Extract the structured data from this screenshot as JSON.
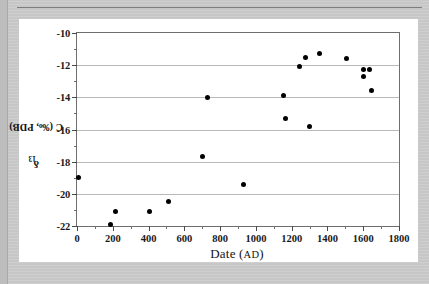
{
  "figure": {
    "background_color": "#ffffff",
    "page_background_color": "#c9c9c9"
  },
  "chart_data": {
    "type": "scatter",
    "title": "",
    "xlabel": "Date (AD)",
    "xlabel_main": "Date (",
    "xlabel_small": "AD",
    "xlabel_close": ")",
    "ylabel": "δ13C (‰, PDB)",
    "ylabel_prefix": "δ",
    "ylabel_sup": "13",
    "ylabel_suffix": "C (‰, PDB)",
    "xlim": [
      0,
      1800
    ],
    "ylim": [
      -22,
      -10
    ],
    "xticks": [
      0,
      200,
      400,
      600,
      800,
      1000,
      1200,
      1400,
      1600,
      1800
    ],
    "xticklabels": [
      "0",
      "200",
      "400",
      "600",
      "800",
      "1000",
      "1200",
      "1400",
      "1600",
      "1800"
    ],
    "x_minor_step": 100,
    "yticks": [
      -10,
      -12,
      -14,
      -16,
      -18,
      -20,
      -22
    ],
    "yticklabels": [
      "-10",
      "-12",
      "-14",
      "-16",
      "-18",
      "-20",
      "-22"
    ],
    "y_minor_step": 1,
    "grid": "horizontal",
    "grid_color": "#b9b9b9",
    "legend": "none",
    "marker": "filled-circle",
    "marker_color": "#000000",
    "points": [
      {
        "x": 6,
        "y": -19.0
      },
      {
        "x": 185,
        "y": -21.9
      },
      {
        "x": 213,
        "y": -21.1
      },
      {
        "x": 408,
        "y": -21.1
      },
      {
        "x": 509,
        "y": -20.5
      },
      {
        "x": 704,
        "y": -17.7
      },
      {
        "x": 732,
        "y": -14.0
      },
      {
        "x": 928,
        "y": -19.4
      },
      {
        "x": 1157,
        "y": -13.9
      },
      {
        "x": 1168,
        "y": -15.3
      },
      {
        "x": 1246,
        "y": -12.1
      },
      {
        "x": 1280,
        "y": -11.5
      },
      {
        "x": 1297,
        "y": -15.8
      },
      {
        "x": 1353,
        "y": -11.3
      },
      {
        "x": 1504,
        "y": -11.6
      },
      {
        "x": 1604,
        "y": -12.3
      },
      {
        "x": 1604,
        "y": -12.7
      },
      {
        "x": 1637,
        "y": -12.3
      },
      {
        "x": 1649,
        "y": -13.6
      }
    ]
  }
}
